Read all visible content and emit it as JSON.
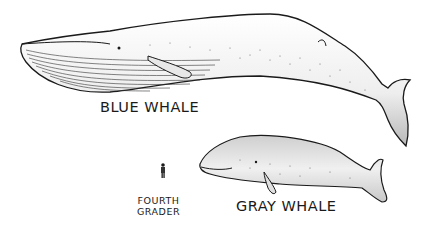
{
  "figure": {
    "labels": {
      "blue_whale": "BLUE WHALE",
      "gray_whale": "GRAY WHALE",
      "kid_line1": "FOURTH",
      "kid_line2": "GRADER"
    },
    "colors": {
      "outline": "#1a1a1a",
      "body_light": "#f2f2f2",
      "body_shade": "#bdbdbd",
      "background": "#ffffff"
    }
  }
}
